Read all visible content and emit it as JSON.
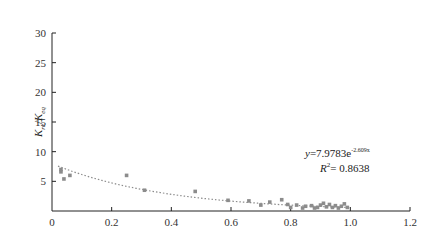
{
  "chart_data": {
    "type": "scatter",
    "title": "",
    "xlabel": "",
    "ylabel": "K_re/K_eq",
    "ylabel_parts": {
      "main1": "K",
      "sub1": "re",
      "slash": "/",
      "main2": "K",
      "sub2": "eq"
    },
    "xlim": [
      0,
      1.2
    ],
    "ylim": [
      0,
      30
    ],
    "x_ticks": [
      "0",
      "0.2",
      "0.4",
      "0.6",
      "0.8",
      "1.0",
      "1.2"
    ],
    "x_tick_values": [
      0,
      0.2,
      0.4,
      0.6,
      0.8,
      1.0,
      1.2
    ],
    "y_ticks": [
      "5",
      "10",
      "15",
      "20",
      "25",
      "30"
    ],
    "y_tick_values": [
      5,
      10,
      15,
      20,
      25,
      30
    ],
    "grid": false,
    "legend": null,
    "series": [
      {
        "name": "observed",
        "marker_color": "#8c8c8c",
        "points": [
          [
            0.03,
            7.0
          ],
          [
            0.03,
            6.6
          ],
          [
            0.04,
            5.4
          ],
          [
            0.06,
            6.0
          ],
          [
            0.25,
            6.0
          ],
          [
            0.31,
            3.5
          ],
          [
            0.48,
            3.3
          ],
          [
            0.59,
            1.8
          ],
          [
            0.66,
            1.7
          ],
          [
            0.7,
            1.0
          ],
          [
            0.73,
            1.5
          ],
          [
            0.77,
            1.9
          ],
          [
            0.79,
            1.1
          ],
          [
            0.8,
            0.6
          ],
          [
            0.82,
            1.0
          ],
          [
            0.84,
            0.5
          ],
          [
            0.85,
            0.8
          ],
          [
            0.87,
            0.9
          ],
          [
            0.88,
            0.5
          ],
          [
            0.89,
            0.6
          ],
          [
            0.9,
            1.0
          ],
          [
            0.91,
            1.3
          ],
          [
            0.92,
            0.7
          ],
          [
            0.93,
            1.1
          ],
          [
            0.94,
            0.6
          ],
          [
            0.95,
            0.9
          ],
          [
            0.96,
            0.5
          ],
          [
            0.97,
            0.8
          ],
          [
            0.98,
            1.2
          ],
          [
            0.99,
            0.6
          ]
        ]
      }
    ],
    "trendline": {
      "type": "exponential",
      "a": 7.9783,
      "b": -2.609,
      "x_range": [
        0.02,
        1.0
      ],
      "color": "#8c8c8c",
      "style": "dotted"
    },
    "annotations": {
      "equation_prefix": "y=7.9783e",
      "equation_exponent": "-2.609x",
      "r2_label": "R",
      "r2_sup": "2",
      "r2_value": "= 0.8638"
    }
  }
}
